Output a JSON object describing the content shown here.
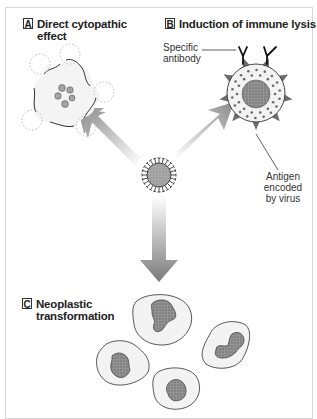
{
  "figure": {
    "panels": [
      {
        "letter": "A",
        "title_line1": "Direct cytopathic",
        "title_line2": "effect"
      },
      {
        "letter": "B",
        "title_line1": "Induction of immune lysis",
        "title_line2": ""
      },
      {
        "letter": "C",
        "title_line1": "Neoplastic",
        "title_line2": "transformation"
      }
    ],
    "labels": {
      "antibody_line1": "Specific",
      "antibody_line2": "antibody",
      "antigen_line1": "Antigen",
      "antigen_line2": "encoded",
      "antigen_line3": "by virus"
    },
    "colors": {
      "border": "#d8d8d8",
      "arrow": "#8a8a8a",
      "outline": "#333333",
      "cell_fill": "#f2f2f2",
      "nucleus": "#8c8c8c",
      "antigen": "#6e6e6e"
    }
  }
}
